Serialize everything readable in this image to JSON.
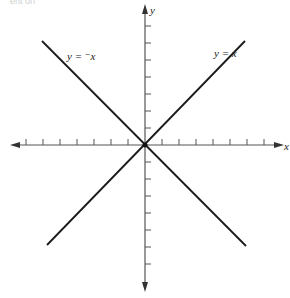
{
  "top_fragment_text": "ent on",
  "diagram": {
    "title": "",
    "axes": {
      "x_label": "x",
      "y_label": "y",
      "origin_px": [
        145,
        145
      ],
      "x_tick_count_each_side": 7,
      "y_tick_count_each_side": 7,
      "tick_spacing_px": 17
    },
    "lines": [
      {
        "name": "identity",
        "label": "y = x",
        "slope": 1
      },
      {
        "name": "negation",
        "label": "y = ⁻x",
        "slope": -1
      }
    ],
    "colors": {
      "axis": "#555555",
      "line": "#1a1a1a",
      "text": "#222222"
    }
  }
}
